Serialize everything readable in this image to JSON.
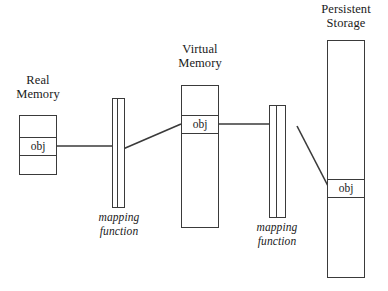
{
  "diagram": {
    "title_real_memory": "Real\nMemory",
    "title_virtual_memory": "Virtual\nMemory",
    "title_persistent_storage": "Persistent\nStorage",
    "mapping_label_1": "mapping\nfunction",
    "mapping_label_2": "mapping\nfunction",
    "obj_real": "obj",
    "obj_virtual": "obj",
    "obj_persistent": "obj",
    "colors": {
      "stroke": "#3a3a3a",
      "text": "#1a1a1a",
      "background": "#ffffff"
    }
  }
}
